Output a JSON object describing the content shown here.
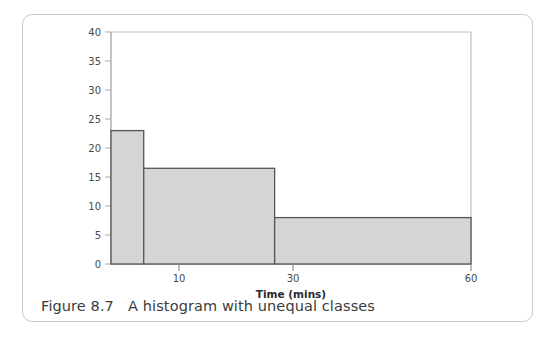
{
  "figure": {
    "caption_prefix": "Figure 8.7",
    "caption_text": "Figure 8.7   A histogram with unequal classes",
    "border_color": "#c9c9c9"
  },
  "chart_data": {
    "type": "bar",
    "title": "",
    "subtitle": "",
    "xlabel": "Time (mins)",
    "ylabel": "",
    "xlim": [
      5,
      60
    ],
    "ylim": [
      0,
      40
    ],
    "grid": false,
    "legend": null,
    "x_tick_labels": [
      "10",
      "30",
      "60"
    ],
    "x_tick_values": [
      10,
      30,
      60
    ],
    "y_tick_labels": [
      "0",
      "5",
      "10",
      "15",
      "20",
      "25",
      "30",
      "35",
      "40"
    ],
    "y_tick_values": [
      0,
      5,
      10,
      15,
      20,
      25,
      30,
      35,
      40
    ],
    "bars": [
      {
        "label": "5-10",
        "x_start": 5,
        "x_end": 10,
        "value": 23
      },
      {
        "label": "10-30",
        "x_start": 10,
        "x_end": 30,
        "value": 16.5
      },
      {
        "label": "30-60",
        "x_start": 30,
        "x_end": 60,
        "value": 8
      }
    ],
    "categories": [
      "5-10",
      "10-30",
      "30-60"
    ],
    "values": [
      23,
      16.5,
      8
    ],
    "bar_fill_color": "#d5d5d5",
    "bar_edge_color": "#555555",
    "axis_color": "#999999"
  }
}
